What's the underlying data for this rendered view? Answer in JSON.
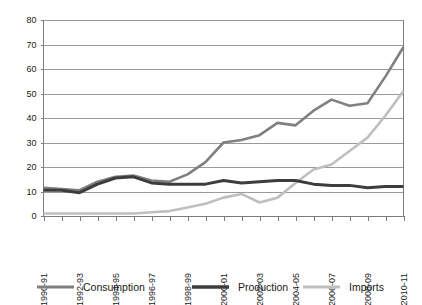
{
  "chart_data": {
    "type": "line",
    "title": "",
    "xlabel": "",
    "ylabel": "",
    "ylim": [
      0,
      80
    ],
    "y_ticks": [
      0,
      10,
      20,
      30,
      40,
      50,
      60,
      70,
      80
    ],
    "grid": "horizontal",
    "legend_position": "bottom",
    "categories": [
      "1990-91",
      "1991-92",
      "1992-93",
      "1993-94",
      "1994-95",
      "1995-96",
      "1996-97",
      "1997-98",
      "1998-99",
      "1999-00",
      "2000-01",
      "2001-02",
      "2002-03",
      "2003-04",
      "2004-05",
      "2005-06",
      "2006-07",
      "2007-08",
      "2008-09",
      "2009-10",
      "2010-11"
    ],
    "x_tick_labels_shown": [
      "1990-91",
      "1992-93",
      "1994-95",
      "1996-97",
      "1998-99",
      "2000-01",
      "2002-03",
      "2004-05",
      "2006-07",
      "2008-09",
      "2010-11"
    ],
    "series": [
      {
        "name": "Consumption",
        "color": "#808080",
        "values": [
          11.5,
          11,
          10.5,
          14,
          16,
          16.5,
          14.5,
          14,
          17,
          22,
          30,
          31,
          33,
          38,
          37,
          43,
          47.5,
          45,
          46,
          57,
          69
        ]
      },
      {
        "name": "Production",
        "color": "#3d3d3d",
        "values": [
          10.5,
          10.5,
          9.5,
          13,
          15.5,
          16,
          13.5,
          13,
          13,
          13,
          14.5,
          13.5,
          14,
          14.5,
          14.5,
          13,
          12.5,
          12.5,
          11.5,
          12,
          12
        ]
      },
      {
        "name": "Imports",
        "color": "#bfbfbf",
        "values": [
          1,
          1,
          1,
          1,
          1,
          1,
          1.5,
          2,
          3.5,
          5,
          7.5,
          9,
          5.5,
          7.5,
          13.5,
          19,
          21,
          26.5,
          32,
          41,
          51
        ]
      }
    ]
  },
  "legend": {
    "items": [
      {
        "label": "Consumption",
        "color": "#808080",
        "width": 3
      },
      {
        "label": "Production",
        "color": "#3d3d3d",
        "width": 3.6
      },
      {
        "label": "Imports",
        "color": "#bfbfbf",
        "width": 3
      }
    ]
  },
  "axis_colors": {
    "gridline": "#9a9a9a",
    "axis": "#7d7d7d",
    "text": "#1a1a1a"
  }
}
